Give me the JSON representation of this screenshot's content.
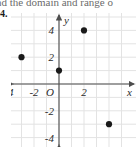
{
  "header": {
    "cropped_text": "nd the domain and range o"
  },
  "problem": {
    "number": "4."
  },
  "chart_data": {
    "type": "scatter",
    "title": "",
    "xlabel": "x",
    "ylabel": "y",
    "xlim": [
      -5,
      5
    ],
    "ylim": [
      -5,
      5
    ],
    "grid": true,
    "legend": "none",
    "x_tick_labels": [
      "-4",
      "-2",
      "2"
    ],
    "x_tick_values": [
      -4,
      -2,
      2
    ],
    "y_tick_labels": [
      "4",
      "2",
      "-2",
      "-4"
    ],
    "y_tick_values": [
      4,
      2,
      -2,
      -4
    ],
    "origin_label": "O",
    "point_color": "#1a1a1a",
    "axis_color": "#4d4d4d",
    "grid_color": "#e3e3e3",
    "points": [
      {
        "x": -3,
        "y": 2
      },
      {
        "x": 0,
        "y": 1
      },
      {
        "x": 2,
        "y": 4
      },
      {
        "x": 4,
        "y": -3
      }
    ],
    "domain": [
      -3,
      0,
      2,
      4
    ],
    "range": [
      2,
      1,
      4,
      -3
    ]
  }
}
